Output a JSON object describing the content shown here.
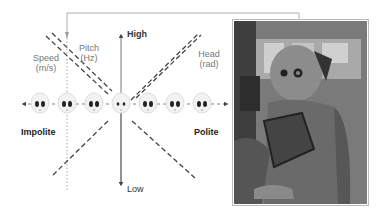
{
  "diagram": {
    "axis": {
      "high_label": "High",
      "low_label": "Low",
      "left_label": "Impolite",
      "right_label": "Polite"
    },
    "parameters": [
      {
        "name": "Speed",
        "unit": "(m/s)",
        "line_style": "dashed-dark",
        "trend": "decreasing-with-politeness"
      },
      {
        "name": "Pitch",
        "unit": "(Hz)",
        "line_style": "dashed-dark",
        "trend": "decreasing-with-politeness"
      },
      {
        "name": "Head",
        "unit": "(rad)",
        "line_style": "dashed-dark",
        "trend": "increasing-with-politeness"
      }
    ],
    "faces": {
      "count": 7,
      "neutral_index": 3
    },
    "photo": {
      "description": "Pepper humanoid robot with chest tablet in an indoor room"
    },
    "colors": {
      "line": "#555555",
      "dashed": "#444444",
      "dotted": "#aaaaaa",
      "text_label": "#777777",
      "text_axis": "#222222"
    }
  }
}
